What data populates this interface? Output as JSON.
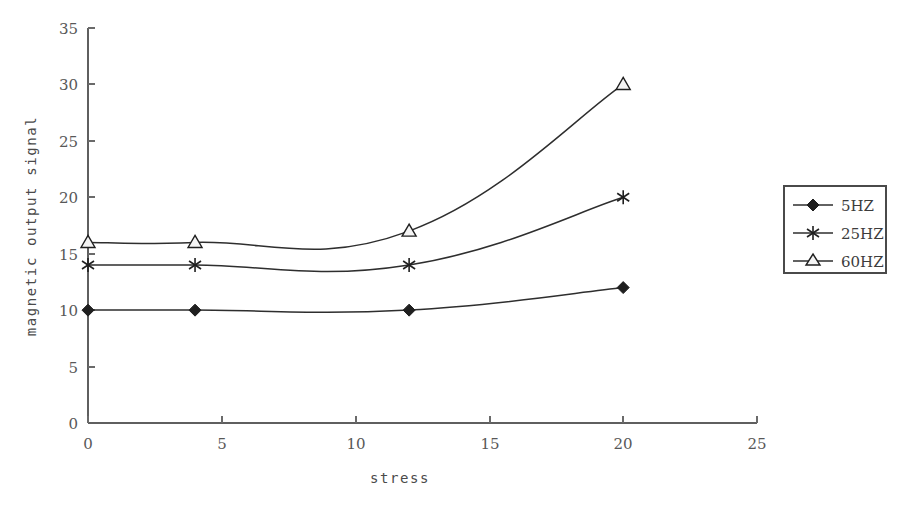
{
  "chart_data": {
    "type": "line",
    "title": "",
    "xlabel": "stress",
    "ylabel": "magnetic output signal",
    "xlim": [
      0,
      25
    ],
    "ylim": [
      0,
      35
    ],
    "x_ticks": [
      "0",
      "5",
      "10",
      "15",
      "20",
      "25"
    ],
    "y_ticks": [
      "0",
      "5",
      "10",
      "15",
      "20",
      "25",
      "30",
      "35"
    ],
    "grid": false,
    "legend_position": "right-outside",
    "x": [
      0,
      4,
      12,
      20
    ],
    "series": [
      {
        "name": "5HZ",
        "marker": "filled-diamond",
        "values": [
          10,
          10,
          10,
          12
        ]
      },
      {
        "name": "25HZ",
        "marker": "asterisk",
        "values": [
          14,
          14,
          14,
          20
        ]
      },
      {
        "name": "60HZ",
        "marker": "open-triangle",
        "values": [
          16,
          16,
          17,
          30
        ]
      }
    ]
  },
  "axes": {
    "y_title": "magnetic output signal",
    "x_title": "stress",
    "x_tick_labels": [
      "0",
      "5",
      "10",
      "15",
      "20",
      "25"
    ],
    "y_tick_labels": [
      "0",
      "5",
      "10",
      "15",
      "20",
      "25",
      "30",
      "35"
    ]
  },
  "legend": {
    "entries": [
      {
        "label": "5HZ"
      },
      {
        "label": "25HZ"
      },
      {
        "label": "60HZ"
      }
    ]
  },
  "colors": {
    "line": "#2e2e2e",
    "axis": "#5f5f5f",
    "text": "#585858",
    "background": "#ffffff"
  }
}
